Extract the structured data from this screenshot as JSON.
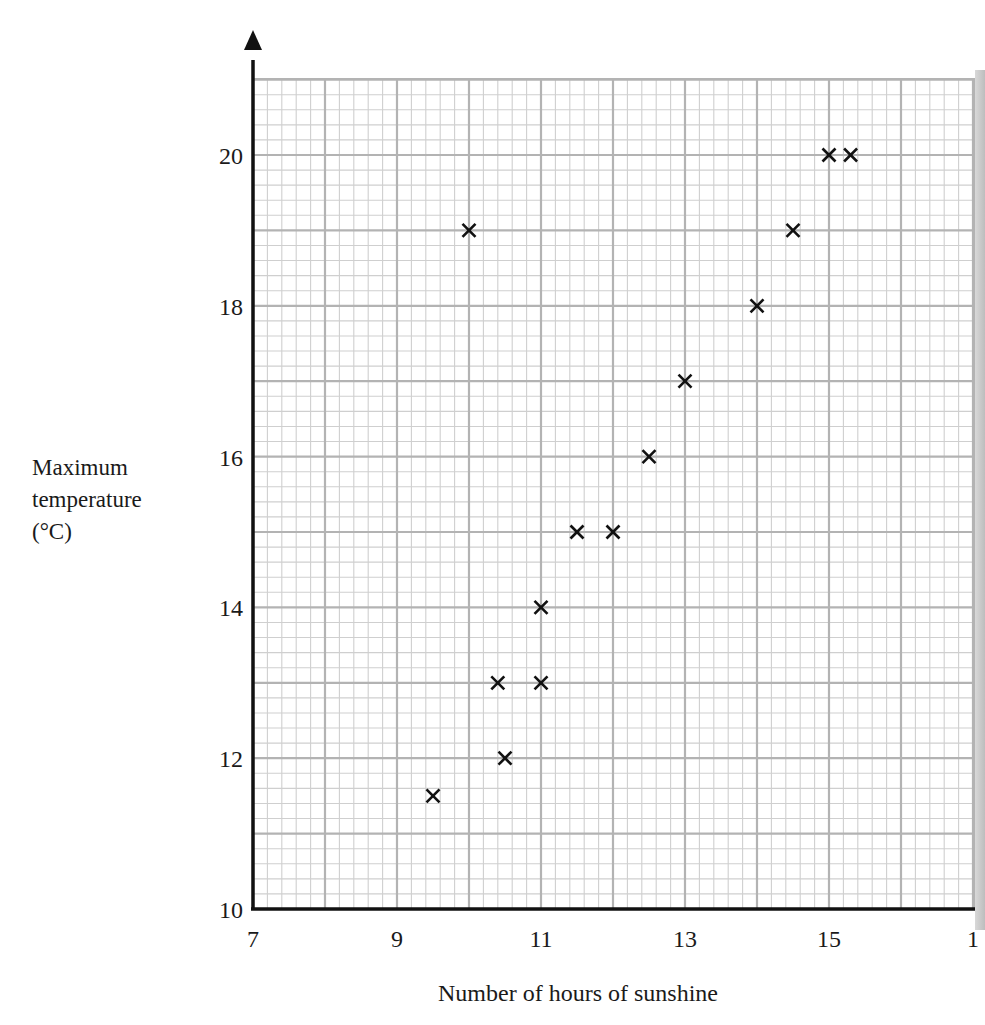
{
  "chart_data": {
    "type": "scatter",
    "title": "",
    "xlabel": "Number of hours of sunshine",
    "ylabel": [
      "Maximum",
      "temperature",
      "(°C)"
    ],
    "xlim": [
      7,
      17
    ],
    "ylim": [
      10,
      21
    ],
    "x_ticks": [
      "7",
      "9",
      "11",
      "13",
      "15",
      "1"
    ],
    "x_tick_values": [
      7,
      9,
      11,
      13,
      15,
      17
    ],
    "y_ticks": [
      "10",
      "12",
      "14",
      "16",
      "18",
      "20"
    ],
    "y_tick_values": [
      10,
      12,
      14,
      16,
      18,
      20
    ],
    "grid": true,
    "grid_minor_per_unit": 5,
    "marker": "x",
    "points": [
      {
        "x": 9.5,
        "y": 11.5
      },
      {
        "x": 10,
        "y": 19
      },
      {
        "x": 10.4,
        "y": 13
      },
      {
        "x": 10.5,
        "y": 12
      },
      {
        "x": 11,
        "y": 13
      },
      {
        "x": 11,
        "y": 14
      },
      {
        "x": 11.5,
        "y": 15
      },
      {
        "x": 12,
        "y": 15
      },
      {
        "x": 12.5,
        "y": 16
      },
      {
        "x": 13,
        "y": 17
      },
      {
        "x": 14,
        "y": 18
      },
      {
        "x": 14.5,
        "y": 19
      },
      {
        "x": 15,
        "y": 20
      },
      {
        "x": 15.3,
        "y": 20
      }
    ]
  },
  "colors": {
    "axis": "#111111",
    "grid_major": "#b3b3b3",
    "grid_minor": "#cfcfcf",
    "marker": "#111111"
  }
}
